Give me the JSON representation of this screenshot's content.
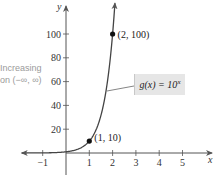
{
  "chart_data": {
    "type": "line",
    "title": "",
    "xlabel": "x",
    "ylabel": "y",
    "function": "g(x) = 10^x",
    "function_label": {
      "prefix": "g(x) = 10",
      "exponent": "x"
    },
    "annotation": {
      "line1": "Increasing",
      "line2": "on (−∞, ∞)"
    },
    "x_ticks": [
      -1,
      1,
      2,
      3,
      4,
      5
    ],
    "x_tick_labels": [
      "−1",
      "1",
      "2",
      "3",
      "4",
      "5"
    ],
    "y_ticks": [
      20,
      40,
      60,
      80,
      100
    ],
    "y_tick_labels": [
      "20",
      "40",
      "60",
      "80",
      "100"
    ],
    "xlim": [
      -2,
      6
    ],
    "ylim": [
      0,
      115
    ],
    "grid": false,
    "labeled_points": [
      {
        "x": 1,
        "y": 10,
        "label": "(1, 10)"
      },
      {
        "x": 2,
        "y": 100,
        "label": "(2, 100)"
      }
    ],
    "series": [
      {
        "name": "g(x) = 10^x",
        "x": [
          -2,
          -1,
          0,
          0.5,
          1,
          1.5,
          2,
          2.05
        ],
        "values": [
          0.01,
          0.1,
          1,
          3.16,
          10,
          31.6,
          100,
          112.2
        ]
      }
    ],
    "colors": {
      "curve": "#444444",
      "axis": "#555555",
      "label_box": "#e6e6e6",
      "annotation": "#9a9a9a"
    }
  }
}
